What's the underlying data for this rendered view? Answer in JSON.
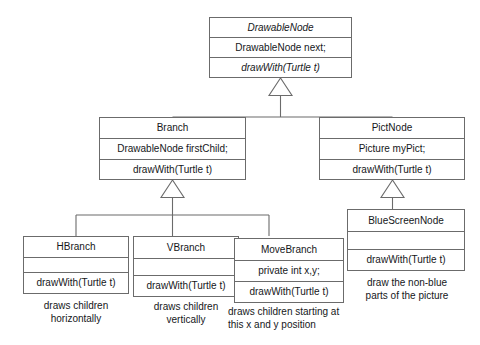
{
  "diagram": {
    "kind": "uml-class-diagram",
    "line_color": "#6b6b6b",
    "text_color": "#15171a",
    "background": "#ffffff",
    "classes": {
      "drawable_node": {
        "name": "DrawableNode",
        "name_abstract": true,
        "attribute": "DrawableNode next;",
        "operation": "drawWith(Turtle t)",
        "operation_abstract": true
      },
      "branch": {
        "name": "Branch",
        "name_abstract": false,
        "attribute": "DrawableNode firstChild;",
        "operation": "drawWith(Turtle t)",
        "operation_abstract": false
      },
      "pict_node": {
        "name": "PictNode",
        "name_abstract": false,
        "attribute": "Picture myPict;",
        "operation": "drawWith(Turtle t)",
        "operation_abstract": false
      },
      "h_branch": {
        "name": "HBranch",
        "name_abstract": false,
        "attribute": "",
        "operation": "drawWith(Turtle t)",
        "operation_abstract": false,
        "note": "draws children\nhorizontally"
      },
      "v_branch": {
        "name": "VBranch",
        "name_abstract": false,
        "attribute": "",
        "operation": "drawWith(Turtle t)",
        "operation_abstract": false,
        "note": "draws children\nvertically"
      },
      "move_branch": {
        "name": "MoveBranch",
        "name_abstract": false,
        "attribute": "private int x,y;",
        "operation": "drawWith(Turtle t)",
        "operation_abstract": false,
        "note": "draws children starting at\nthis x and y position"
      },
      "blue_screen_node": {
        "name": "BlueScreenNode",
        "name_abstract": false,
        "attribute": "",
        "operation": "drawWith(Turtle t)",
        "operation_abstract": false,
        "note": "draw the non-blue\nparts of the picture"
      }
    },
    "generalizations": [
      {
        "parent": "DrawableNode",
        "children": [
          "Branch",
          "PictNode"
        ],
        "marker": "hollow-triangle"
      },
      {
        "parent": "Branch",
        "children": [
          "HBranch",
          "VBranch",
          "MoveBranch"
        ],
        "marker": "hollow-triangle"
      },
      {
        "parent": "PictNode",
        "children": [
          "BlueScreenNode"
        ],
        "marker": "hollow-triangle"
      }
    ]
  }
}
